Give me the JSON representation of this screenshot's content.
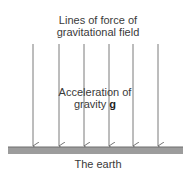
{
  "diagram": {
    "title_line1": "Lines of force of",
    "title_line2": "gravitational field",
    "acceleration_line1": "Acceleration of",
    "acceleration_line2_prefix": "gravity ",
    "acceleration_symbol": "g",
    "ground_label": "The earth",
    "line_count": 6,
    "line_color": "#777777",
    "ground_color": "#9a9a9a"
  }
}
